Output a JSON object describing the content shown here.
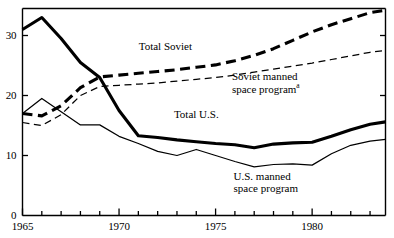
{
  "chart_data": {
    "type": "line",
    "title": "",
    "subtitle": "",
    "xlabel": "",
    "ylabel": "",
    "xlim": [
      1965,
      1983.8
    ],
    "ylim": [
      0,
      34.5
    ],
    "grid": false,
    "legend_position": "inline-annotations",
    "y_ticks": [
      0,
      10,
      20,
      30
    ],
    "y_tick_labels": [
      "0",
      "10",
      "20",
      "30"
    ],
    "x_ticks": [
      1965,
      1966,
      1967,
      1968,
      1969,
      1970,
      1971,
      1972,
      1973,
      1974,
      1975,
      1976,
      1977,
      1978,
      1979,
      1980,
      1981,
      1982,
      1983
    ],
    "x_tick_labels": [
      "1965",
      "",
      "",
      "",
      "",
      "1970",
      "",
      "",
      "",
      "",
      "1975",
      "",
      "",
      "",
      "",
      "1980",
      "",
      "",
      ""
    ],
    "x": [
      1965,
      1966,
      1967,
      1968,
      1969,
      1970,
      1971,
      1972,
      1973,
      1974,
      1975,
      1976,
      1977,
      1978,
      1979,
      1980,
      1981,
      1982,
      1983,
      1983.8
    ],
    "series": [
      {
        "name": "Total U.S.",
        "style": "solid",
        "width": "thick",
        "color": "#000000",
        "values": [
          31.0,
          33.0,
          29.5,
          25.5,
          23.0,
          17.5,
          13.3,
          13.0,
          12.6,
          12.3,
          12.0,
          11.8,
          11.3,
          11.9,
          12.1,
          12.2,
          13.2,
          14.3,
          15.2,
          15.6
        ]
      },
      {
        "name": "Total Soviet",
        "style": "dashed",
        "width": "thick",
        "color": "#000000",
        "values": [
          17.0,
          16.6,
          18.3,
          21.3,
          23.1,
          23.4,
          23.7,
          24.0,
          24.3,
          24.7,
          25.1,
          25.8,
          26.7,
          27.8,
          29.2,
          30.6,
          31.8,
          32.8,
          33.8,
          34.2
        ]
      },
      {
        "name": "Soviet manned space program",
        "style": "dashed",
        "width": "thin",
        "color": "#000000",
        "values": [
          15.5,
          15.0,
          16.8,
          20.0,
          21.5,
          21.7,
          21.9,
          22.1,
          22.4,
          22.7,
          23.0,
          23.4,
          23.9,
          24.4,
          24.9,
          25.4,
          26.0,
          26.6,
          27.2,
          27.5
        ]
      },
      {
        "name": "U.S. manned space program",
        "style": "solid",
        "width": "thin",
        "color": "#000000",
        "values": [
          17.0,
          19.5,
          17.3,
          15.1,
          15.1,
          13.2,
          12.0,
          10.7,
          10.0,
          11.0,
          10.0,
          9.0,
          8.1,
          8.5,
          8.6,
          8.4,
          10.3,
          11.7,
          12.4,
          12.7
        ]
      }
    ],
    "annotations": [
      {
        "id": "total-soviet",
        "text": "Total Soviet",
        "lines": [
          "Total Soviet"
        ],
        "superscript": "",
        "x": 1972.4,
        "y": 28.2
      },
      {
        "id": "soviet-manned",
        "text": "Soviet manned space program",
        "lines": [
          "Soviet manned",
          "space program"
        ],
        "superscript": "a",
        "x": 1977.6,
        "y": 23.2
      },
      {
        "id": "total-us",
        "text": "Total U.S.",
        "lines": [
          "Total U.S."
        ],
        "superscript": "",
        "x": 1974.0,
        "y": 17.0
      },
      {
        "id": "us-manned",
        "text": "U.S. manned space program",
        "lines": [
          "U.S. manned",
          "space program"
        ],
        "superscript": "",
        "x": 1977.6,
        "y": 6.6
      }
    ]
  }
}
